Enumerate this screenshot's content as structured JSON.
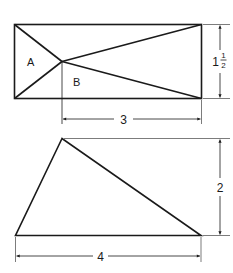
{
  "figure": {
    "rectangle": {
      "regions": [
        {
          "label": "A"
        },
        {
          "label": "B"
        }
      ],
      "width_label": "3",
      "height_whole": "1",
      "height_fraction_num": "1",
      "height_fraction_den": "2",
      "width_value": 3,
      "height_value": 1.5
    },
    "triangle": {
      "base_label": "4",
      "height_label": "2",
      "base_value": 4,
      "height_value": 2
    }
  }
}
